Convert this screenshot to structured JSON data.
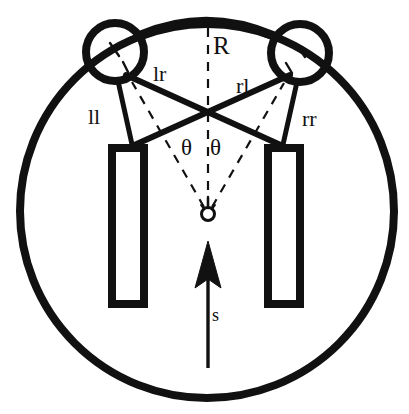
{
  "figure": {
    "background_color": "#ffffff",
    "stroke_color": "#111111"
  },
  "labels": {
    "radius": "R",
    "left_to_right": "lr",
    "right_to_left": "rl",
    "left_to_left": "ll",
    "right_to_right": "rr",
    "theta_left": "θ",
    "theta_right": "θ",
    "sensor_heading": "s"
  },
  "geometry": {
    "outer_circle": {
      "cx": 207,
      "cy": 211,
      "r": 187,
      "stroke_width": 8
    },
    "left_beacon_circle": {
      "cx": 115,
      "cy": 52,
      "r": 29,
      "stroke_width": 8
    },
    "right_beacon_circle": {
      "cx": 300,
      "cy": 53,
      "r": 29,
      "stroke_width": 8
    },
    "left_rect": {
      "x": 112,
      "y": 148,
      "w": 32,
      "h": 156,
      "stroke_width": 8
    },
    "right_rect": {
      "x": 268,
      "y": 148,
      "w": 32,
      "h": 156,
      "stroke_width": 8
    },
    "sensor_marker": {
      "cx": 208,
      "cy": 214,
      "r": 7,
      "stroke_width": 3
    },
    "crossing_point": {
      "x": 206,
      "y": 117
    },
    "heading_arrow": {
      "x": 208,
      "y_tip": 243,
      "y_tail": 368
    },
    "top_arc": {
      "from_x": 140,
      "from_y": 36,
      "to_x": 275,
      "to_y": 37,
      "apex_y": 20
    }
  },
  "label_positions": {
    "radius": {
      "x": 215,
      "y": 36
    },
    "left_to_right": {
      "x": 154,
      "y": 63
    },
    "right_to_left": {
      "x": 236,
      "y": 76
    },
    "left_to_left": {
      "x": 89,
      "y": 107
    },
    "right_to_right": {
      "x": 303,
      "y": 108
    },
    "theta_left": {
      "x": 182,
      "y": 137
    },
    "theta_right": {
      "x": 210,
      "y": 137
    },
    "sensor_heading": {
      "x": 212,
      "y": 307
    }
  }
}
